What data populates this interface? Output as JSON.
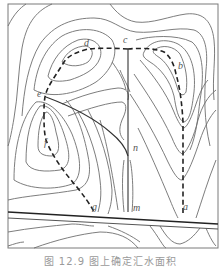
{
  "figure": {
    "caption": "图 12.9   图上确定汇水面积",
    "labels": {
      "a": "a",
      "b": "b",
      "c": "c",
      "d": "d",
      "e": "e",
      "f": "f",
      "g": "g",
      "m": "m",
      "n": "n"
    }
  }
}
